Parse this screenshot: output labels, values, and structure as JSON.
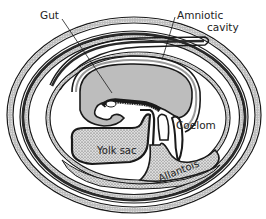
{
  "diagram": {
    "labels": {
      "gut": "Gut",
      "amniotic_line1": "Amniotic",
      "amniotic_line2": "cavity",
      "coelom": "Coelom",
      "yolk_sac": "Yolk sac",
      "allantois": "Allantois"
    },
    "colors": {
      "background": "#ffffff",
      "outline": "#1a1a1a",
      "embryo_fill": "#bdbdbd",
      "membrane_fill": "#9a9a9a",
      "stipple_fill": "#d8d8d8",
      "stipple_dot": "#4a4a4a",
      "dark_band": "#2a2a2a",
      "text": "#222222"
    }
  }
}
